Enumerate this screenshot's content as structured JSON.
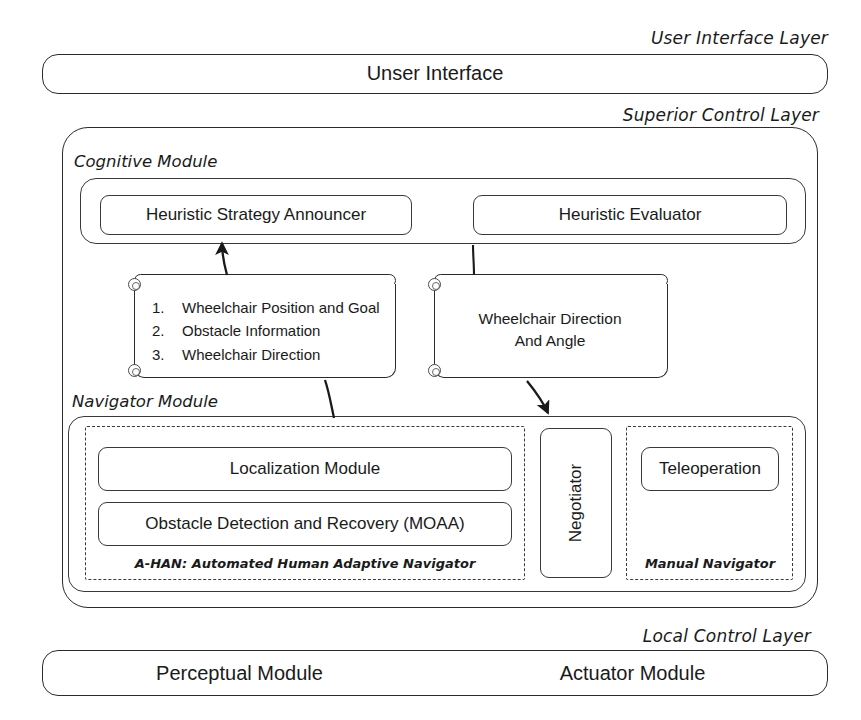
{
  "diagram": {
    "stroke_color": "#2b2b2b",
    "background": "#ffffff"
  },
  "layers": {
    "user_interface": {
      "label": "User Interface Layer",
      "box_label": "Unser Interface"
    },
    "superior_control": {
      "label": "Superior Control Layer"
    },
    "local_control": {
      "label": "Local Control Layer",
      "modules": [
        "Perceptual Module",
        "Actuator Module"
      ]
    }
  },
  "cognitive_module": {
    "label": "Cognitive Module",
    "blocks": [
      "Heuristic Strategy Announcer",
      "Heuristic Evaluator"
    ]
  },
  "data_notes": {
    "left": {
      "items": [
        {
          "num": "1.",
          "text": "Wheelchair Position and Goal"
        },
        {
          "num": "2.",
          "text": "Obstacle Information"
        },
        {
          "num": "3.",
          "text": "Wheelchair Direction"
        }
      ]
    },
    "right": {
      "line1": "Wheelchair Direction",
      "line2": "And Angle"
    }
  },
  "navigator_module": {
    "label": "Navigator Module",
    "ahan": {
      "caption": "A-HAN: Automated Human Adaptive Navigator",
      "blocks": [
        "Localization Module",
        "Obstacle Detection and Recovery (MOAA)"
      ]
    },
    "negotiator": {
      "label": "Negotiator"
    },
    "manual_navigator": {
      "caption": "Manual Navigator",
      "blocks": [
        "Teleoperation"
      ]
    }
  }
}
